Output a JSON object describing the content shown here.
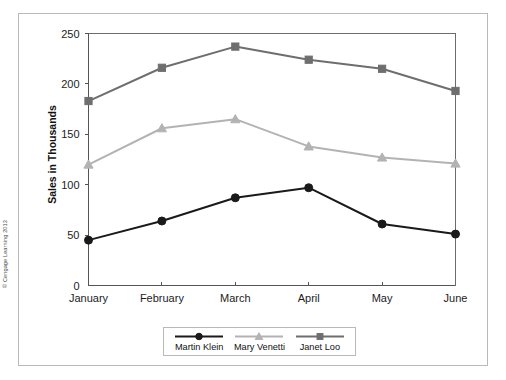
{
  "credit": "© Cengage Learning 2013",
  "legend": {
    "entries": [
      {
        "label": "Martin Klein",
        "color": "#1a1a1a",
        "marker": "circle",
        "swatch_name": "legend-swatch-martin-klein"
      },
      {
        "label": "Mary Venetti",
        "color": "#b3b3b3",
        "marker": "triangle",
        "swatch_name": "legend-swatch-mary-venetti"
      },
      {
        "label": "Janet Loo",
        "color": "#6e6e6e",
        "marker": "square",
        "swatch_name": "legend-swatch-janet-loo"
      }
    ]
  },
  "chart_data": {
    "type": "line",
    "title": "",
    "xlabel": "",
    "ylabel": "Sales in Thousands",
    "categories": [
      "January",
      "February",
      "March",
      "April",
      "May",
      "June"
    ],
    "ylim": [
      0,
      250
    ],
    "yticks": [
      0,
      50,
      100,
      150,
      200,
      250
    ],
    "ytick_labels": [
      "0",
      "50",
      "100",
      "150",
      "200",
      "250"
    ],
    "grid": false,
    "legend_position": "bottom",
    "series": [
      {
        "name": "Martin Klein",
        "color": "#1a1a1a",
        "marker": "circle",
        "values": [
          45,
          64,
          87,
          97,
          61,
          51
        ]
      },
      {
        "name": "Mary Venetti",
        "color": "#b3b3b3",
        "marker": "triangle",
        "values": [
          120,
          156,
          165,
          138,
          127,
          121
        ]
      },
      {
        "name": "Janet Loo",
        "color": "#6e6e6e",
        "marker": "square",
        "values": [
          183,
          216,
          237,
          224,
          215,
          193
        ]
      }
    ]
  }
}
